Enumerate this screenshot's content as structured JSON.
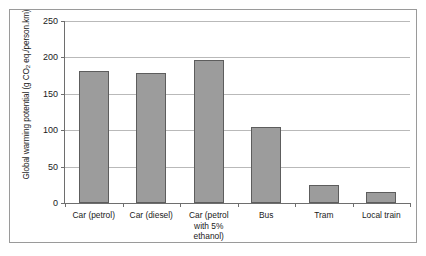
{
  "chart_data": {
    "type": "bar",
    "title": "",
    "xlabel": "",
    "ylabel": "Global warming potential (g CO2 eq./person.km)",
    "ylabel_parts": {
      "before": "Global warming potential (g CO",
      "sub": "2",
      "after": " eq./person.km)"
    },
    "categories": [
      "Car (petrol)",
      "Car (diesel)",
      "Car (petrol with 5% ethanol)",
      "Bus",
      "Tram",
      "Local train"
    ],
    "category_label_lines": [
      [
        "Car (petrol)"
      ],
      [
        "Car (diesel)"
      ],
      [
        "Car (petrol",
        "with 5%",
        "ethanol)"
      ],
      [
        "Bus"
      ],
      [
        "Tram"
      ],
      [
        "Local train"
      ]
    ],
    "values": [
      182,
      178,
      197,
      105,
      25,
      15
    ],
    "ylim": [
      0,
      250
    ],
    "ytick_labels": [
      "0",
      "50",
      "100",
      "150",
      "200",
      "250"
    ],
    "ytick_values": [
      0,
      50,
      100,
      150,
      200,
      250
    ],
    "grid": true,
    "legend": "none",
    "series_color": "#9c9c9c",
    "bar_edge_color": "#5d5d5d",
    "gridline_color": "#b9b9b9",
    "axis_color": "#6e6e6e",
    "background_color": "#ffffff",
    "frame_color": "#9a9a9a"
  }
}
